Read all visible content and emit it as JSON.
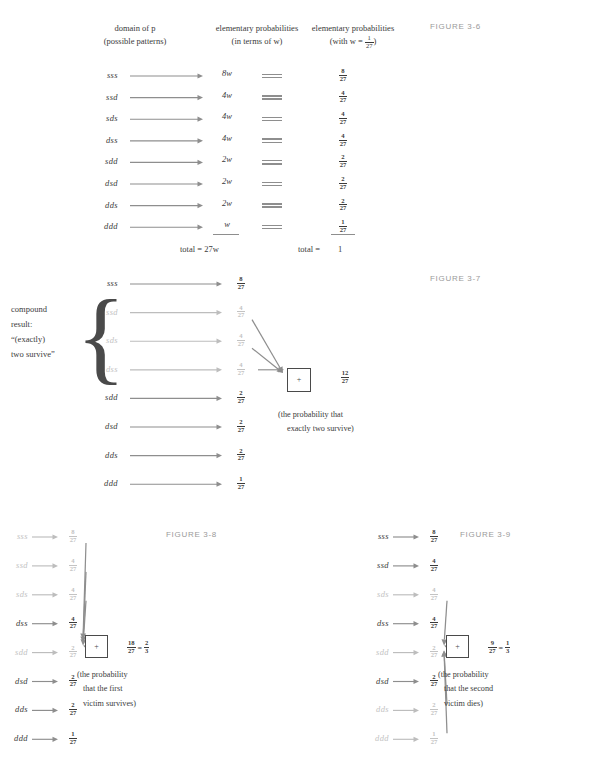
{
  "figure36": {
    "label": "FIGURE 3-6",
    "headers": [
      {
        "line1": "domain of p",
        "line2": "(possible patterns)"
      },
      {
        "line1": "elementary probabilities",
        "line2": "(in terms of w)"
      },
      {
        "line1": "elementary probabilities",
        "line2_pre": "(with w = ",
        "line2_frac_n": "1",
        "line2_frac_d": "27",
        "line2_post": ")"
      }
    ],
    "rows": [
      {
        "pattern": "sss",
        "in_w": "8w",
        "frac_n": "8",
        "frac_d": "27"
      },
      {
        "pattern": "ssd",
        "in_w": "4w",
        "frac_n": "4",
        "frac_d": "27"
      },
      {
        "pattern": "sds",
        "in_w": "4w",
        "frac_n": "4",
        "frac_d": "27"
      },
      {
        "pattern": "dss",
        "in_w": "4w",
        "frac_n": "4",
        "frac_d": "27"
      },
      {
        "pattern": "sdd",
        "in_w": "2w",
        "frac_n": "2",
        "frac_d": "27"
      },
      {
        "pattern": "dsd",
        "in_w": "2w",
        "frac_n": "2",
        "frac_d": "27"
      },
      {
        "pattern": "dds",
        "in_w": "2w",
        "frac_n": "2",
        "frac_d": "27"
      },
      {
        "pattern": "ddd",
        "in_w": "w",
        "frac_n": "1",
        "frac_d": "27"
      }
    ],
    "total_w_label": "total = 27w",
    "total_num_label": "total =",
    "total_num_value": "1"
  },
  "figure37": {
    "label": "FIGURE 3-7",
    "compound_label": [
      "compound",
      "result:",
      "“(exactly)",
      "two survive”"
    ],
    "rows": [
      {
        "pattern": "sss",
        "frac_n": "8",
        "frac_d": "27",
        "dim": false,
        "arrow_to_sum": false
      },
      {
        "pattern": "ssd",
        "frac_n": "4",
        "frac_d": "27",
        "dim": true,
        "arrow_to_sum": true
      },
      {
        "pattern": "sds",
        "frac_n": "4",
        "frac_d": "27",
        "dim": true,
        "arrow_to_sum": true
      },
      {
        "pattern": "dss",
        "frac_n": "4",
        "frac_d": "27",
        "dim": true,
        "arrow_to_sum": true
      },
      {
        "pattern": "sdd",
        "frac_n": "2",
        "frac_d": "27",
        "dim": false,
        "arrow_to_sum": false
      },
      {
        "pattern": "dsd",
        "frac_n": "2",
        "frac_d": "27",
        "dim": false,
        "arrow_to_sum": false
      },
      {
        "pattern": "dds",
        "frac_n": "2",
        "frac_d": "27",
        "dim": false,
        "arrow_to_sum": false
      },
      {
        "pattern": "ddd",
        "frac_n": "1",
        "frac_d": "27",
        "dim": false,
        "arrow_to_sum": false
      }
    ],
    "sum_symbol": "+",
    "result_n": "12",
    "result_d": "27",
    "note": [
      "(the probability that",
      "exactly two survive)"
    ]
  },
  "figure38": {
    "label": "FIGURE 3-8",
    "rows": [
      {
        "pattern": "sss",
        "frac_n": "8",
        "frac_d": "27",
        "dim": true,
        "arrow_to_sum": true
      },
      {
        "pattern": "ssd",
        "frac_n": "4",
        "frac_d": "27",
        "dim": true,
        "arrow_to_sum": true
      },
      {
        "pattern": "sds",
        "frac_n": "4",
        "frac_d": "27",
        "dim": true,
        "arrow_to_sum": true
      },
      {
        "pattern": "dss",
        "frac_n": "4",
        "frac_d": "27",
        "dim": false,
        "arrow_to_sum": false
      },
      {
        "pattern": "sdd",
        "frac_n": "2",
        "frac_d": "27",
        "dim": true,
        "arrow_to_sum": true
      },
      {
        "pattern": "dsd",
        "frac_n": "2",
        "frac_d": "27",
        "dim": false,
        "arrow_to_sum": false
      },
      {
        "pattern": "dds",
        "frac_n": "2",
        "frac_d": "27",
        "dim": false,
        "arrow_to_sum": false
      },
      {
        "pattern": "ddd",
        "frac_n": "1",
        "frac_d": "27",
        "dim": false,
        "arrow_to_sum": false
      }
    ],
    "sum_symbol": "+",
    "result_n": "18",
    "result_d": "27",
    "equals": "=",
    "simplified_n": "2",
    "simplified_d": "3",
    "note": [
      "(the probability",
      "that the first",
      "victim survives)"
    ]
  },
  "figure39": {
    "label": "FIGURE 3-9",
    "rows": [
      {
        "pattern": "sss",
        "frac_n": "8",
        "frac_d": "27",
        "dim": false,
        "arrow_to_sum": false
      },
      {
        "pattern": "ssd",
        "frac_n": "4",
        "frac_d": "27",
        "dim": false,
        "arrow_to_sum": false
      },
      {
        "pattern": "sds",
        "frac_n": "4",
        "frac_d": "27",
        "dim": true,
        "arrow_to_sum": true
      },
      {
        "pattern": "dss",
        "frac_n": "4",
        "frac_d": "27",
        "dim": false,
        "arrow_to_sum": false
      },
      {
        "pattern": "sdd",
        "frac_n": "2",
        "frac_d": "27",
        "dim": true,
        "arrow_to_sum": true
      },
      {
        "pattern": "dsd",
        "frac_n": "2",
        "frac_d": "27",
        "dim": false,
        "arrow_to_sum": false
      },
      {
        "pattern": "dds",
        "frac_n": "2",
        "frac_d": "27",
        "dim": true,
        "arrow_to_sum": true
      },
      {
        "pattern": "ddd",
        "frac_n": "1",
        "frac_d": "27",
        "dim": true,
        "arrow_to_sum": true
      }
    ],
    "sum_symbol": "+",
    "result_n": "9",
    "result_d": "27",
    "equals": "=",
    "simplified_n": "1",
    "simplified_d": "3",
    "note": [
      "(the probability",
      "that the second",
      "victim dies)"
    ]
  },
  "colors": {
    "ink": "#3b3b3b",
    "dim": "#c3c3c3",
    "arrow": "#8e8e8e",
    "figure_label": "#9a9a9a"
  }
}
